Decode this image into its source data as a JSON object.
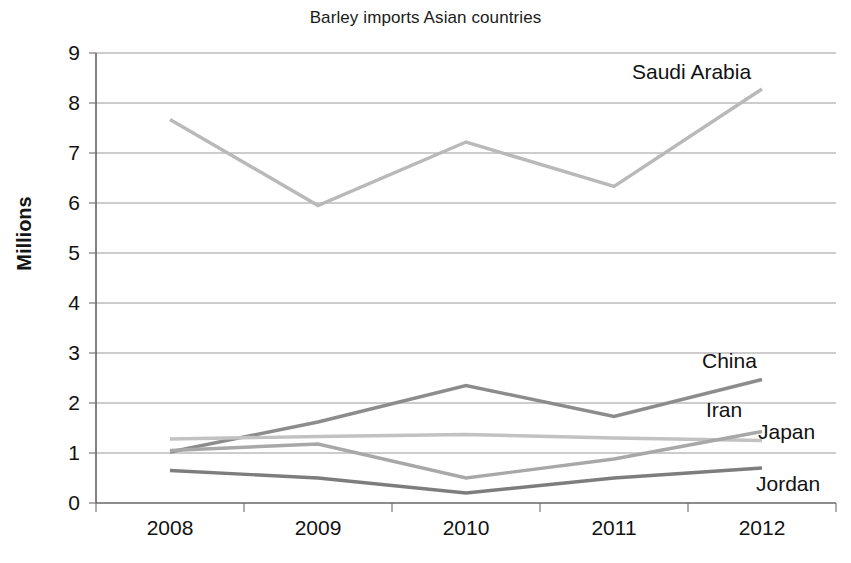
{
  "chart_data": {
    "type": "line",
    "title": "Barley imports Asian countries",
    "xlabel": "",
    "ylabel": "Millions",
    "categories": [
      "2008",
      "2009",
      "2010",
      "2011",
      "2012"
    ],
    "ylim": [
      0,
      9
    ],
    "ytick_labels": [
      "0",
      "1",
      "2",
      "3",
      "4",
      "5",
      "6",
      "7",
      "8",
      "9"
    ],
    "yticks": [
      0,
      1,
      2,
      3,
      4,
      5,
      6,
      7,
      8,
      9
    ],
    "grid": true,
    "grid_axis": "y",
    "legend_position": "inline-right-of-line-ends",
    "series": [
      {
        "name": "Saudi Arabia",
        "values": [
          7.67,
          5.95,
          7.22,
          6.33,
          8.28
        ],
        "color": "#b9b9b9"
      },
      {
        "name": "China",
        "values": [
          1.02,
          1.62,
          2.35,
          1.73,
          2.47
        ],
        "color": "#8c8c8c"
      },
      {
        "name": "Iran",
        "values": [
          1.28,
          1.33,
          1.37,
          1.3,
          1.25
        ],
        "color": "#c2c2c2"
      },
      {
        "name": "Japan",
        "values": [
          1.05,
          1.18,
          0.5,
          0.88,
          1.43
        ],
        "color": "#a8a8a8"
      },
      {
        "name": "Jordan",
        "values": [
          0.65,
          0.5,
          0.2,
          0.5,
          0.7
        ],
        "color": "#7d7d7d"
      }
    ]
  },
  "annotations": {
    "saudi_arabia_label": "Saudi Arabia",
    "china_label": "China",
    "iran_label": "Iran",
    "japan_label": "Japan",
    "jordan_label": "Jordan"
  }
}
